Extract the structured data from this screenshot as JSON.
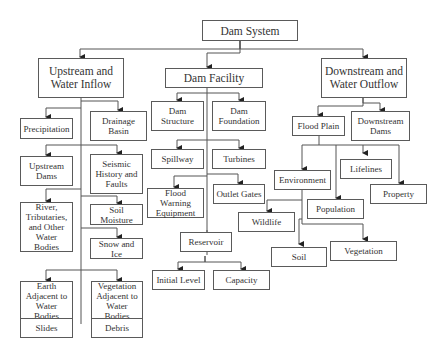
{
  "diagram": {
    "title": "Dam System",
    "nodes": [
      {
        "id": "dam-system",
        "label": "Dam System"
      },
      {
        "id": "upstream",
        "label": "Upstream and\nWater Inflow"
      },
      {
        "id": "dam-facility",
        "label": "Dam Facility"
      },
      {
        "id": "downstream",
        "label": "Downstream and\nWater Outflow"
      },
      {
        "id": "precipitation",
        "label": "Precipitation"
      },
      {
        "id": "drainage-basin",
        "label": "Drainage\nBasin"
      },
      {
        "id": "upstream-dams",
        "label": "Upstream\nDams"
      },
      {
        "id": "seismic",
        "label": "Seismic\nHistory and\nFaults"
      },
      {
        "id": "river",
        "label": "River,\nTributaries,\nand Other\nWater Bodies"
      },
      {
        "id": "soil-moisture",
        "label": "Soil Moisture"
      },
      {
        "id": "snow-ice",
        "label": "Snow and Ice"
      },
      {
        "id": "earth-adjacent",
        "label": "Earth\nAdjacent to\nWater Bodies"
      },
      {
        "id": "vegetation-adjacent",
        "label": "Vegetation\nAdjacent to\nWater Bodies"
      },
      {
        "id": "slides",
        "label": "Slides"
      },
      {
        "id": "debris",
        "label": "Debris"
      },
      {
        "id": "dam-structure",
        "label": "Dam\nStructure"
      },
      {
        "id": "dam-foundation",
        "label": "Dam\nFoundation"
      },
      {
        "id": "spillway",
        "label": "Spillway"
      },
      {
        "id": "turbines",
        "label": "Turbines"
      },
      {
        "id": "flood-warning",
        "label": "Flood Warning\nEquipment"
      },
      {
        "id": "outlet-gates",
        "label": "Outlet Gates"
      },
      {
        "id": "reservoir",
        "label": "Reservoir"
      },
      {
        "id": "initial-level",
        "label": "Initial Level"
      },
      {
        "id": "capacity",
        "label": "Capacity"
      },
      {
        "id": "flood-plain",
        "label": "Flood Plain"
      },
      {
        "id": "downstream-dams",
        "label": "Downstream\nDams"
      },
      {
        "id": "environment",
        "label": "Environment"
      },
      {
        "id": "lifelines",
        "label": "Lifelines"
      },
      {
        "id": "property",
        "label": "Property"
      },
      {
        "id": "population",
        "label": "Population"
      },
      {
        "id": "wildlife",
        "label": "Wildlife"
      },
      {
        "id": "soil",
        "label": "Soil"
      },
      {
        "id": "vegetation",
        "label": "Vegetation"
      }
    ],
    "edges": [
      [
        "dam-system",
        "upstream"
      ],
      [
        "dam-system",
        "dam-facility"
      ],
      [
        "dam-system",
        "downstream"
      ],
      [
        "upstream",
        "precipitation"
      ],
      [
        "upstream",
        "drainage-basin"
      ],
      [
        "upstream",
        "upstream-dams"
      ],
      [
        "upstream",
        "seismic"
      ],
      [
        "upstream",
        "river"
      ],
      [
        "upstream",
        "soil-moisture"
      ],
      [
        "upstream",
        "snow-ice"
      ],
      [
        "upstream",
        "earth-adjacent"
      ],
      [
        "upstream",
        "vegetation-adjacent"
      ],
      [
        "earth-adjacent",
        "slides"
      ],
      [
        "vegetation-adjacent",
        "debris"
      ],
      [
        "dam-facility",
        "dam-structure"
      ],
      [
        "dam-facility",
        "dam-foundation"
      ],
      [
        "dam-facility",
        "spillway"
      ],
      [
        "dam-facility",
        "turbines"
      ],
      [
        "dam-facility",
        "flood-warning"
      ],
      [
        "dam-facility",
        "outlet-gates"
      ],
      [
        "dam-facility",
        "reservoir"
      ],
      [
        "reservoir",
        "initial-level"
      ],
      [
        "reservoir",
        "capacity"
      ],
      [
        "downstream",
        "flood-plain"
      ],
      [
        "downstream",
        "downstream-dams"
      ],
      [
        "flood-plain",
        "environment"
      ],
      [
        "flood-plain",
        "lifelines"
      ],
      [
        "flood-plain",
        "property"
      ],
      [
        "flood-plain",
        "population"
      ],
      [
        "environment",
        "wildlife"
      ],
      [
        "environment",
        "soil"
      ],
      [
        "environment",
        "vegetation"
      ]
    ]
  }
}
